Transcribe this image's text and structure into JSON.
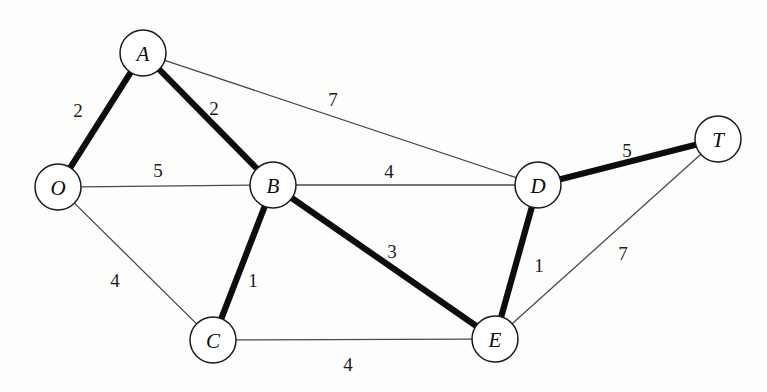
{
  "diagram": {
    "type": "weighted-undirected-graph",
    "title": "",
    "width": 767,
    "height": 392,
    "background_color": "#fdfdfc",
    "node_radius": 23,
    "node_fill": "#ffffff",
    "node_stroke": "#1a1a1a",
    "thin_edge_color": "#4a4a4a",
    "bold_edge_color": "#0d0d0d",
    "nodes": [
      {
        "id": "A",
        "label": "A",
        "x": 143,
        "y": 53
      },
      {
        "id": "O",
        "label": "O",
        "x": 58,
        "y": 187
      },
      {
        "id": "B",
        "label": "B",
        "x": 273,
        "y": 185
      },
      {
        "id": "D",
        "label": "D",
        "x": 538,
        "y": 185
      },
      {
        "id": "T",
        "label": "T",
        "x": 718,
        "y": 139
      },
      {
        "id": "C",
        "label": "C",
        "x": 213,
        "y": 340
      },
      {
        "id": "E",
        "label": "E",
        "x": 495,
        "y": 339
      }
    ],
    "edges": [
      {
        "id": "O-A",
        "from": "O",
        "to": "A",
        "weight": "2",
        "highlighted": true,
        "label_x": 78,
        "label_y": 110
      },
      {
        "id": "A-B",
        "from": "A",
        "to": "B",
        "weight": "2",
        "highlighted": true,
        "label_x": 214,
        "label_y": 108
      },
      {
        "id": "A-D",
        "from": "A",
        "to": "D",
        "weight": "7",
        "highlighted": false,
        "label_x": 333,
        "label_y": 99
      },
      {
        "id": "O-B",
        "from": "O",
        "to": "B",
        "weight": "5",
        "highlighted": false,
        "label_x": 158,
        "label_y": 170
      },
      {
        "id": "B-D",
        "from": "B",
        "to": "D",
        "weight": "4",
        "highlighted": false,
        "label_x": 389,
        "label_y": 171
      },
      {
        "id": "D-T",
        "from": "D",
        "to": "T",
        "weight": "5",
        "highlighted": true,
        "label_x": 627,
        "label_y": 150
      },
      {
        "id": "O-C",
        "from": "O",
        "to": "C",
        "weight": "4",
        "highlighted": false,
        "label_x": 115,
        "label_y": 280
      },
      {
        "id": "B-C",
        "from": "B",
        "to": "C",
        "weight": "1",
        "highlighted": true,
        "label_x": 253,
        "label_y": 280
      },
      {
        "id": "B-E",
        "from": "B",
        "to": "E",
        "weight": "3",
        "highlighted": true,
        "label_x": 392,
        "label_y": 251
      },
      {
        "id": "D-E",
        "from": "D",
        "to": "E",
        "weight": "1",
        "highlighted": true,
        "label_x": 539,
        "label_y": 265
      },
      {
        "id": "E-T",
        "from": "E",
        "to": "T",
        "weight": "7",
        "highlighted": false,
        "label_x": 623,
        "label_y": 253
      },
      {
        "id": "C-E",
        "from": "C",
        "to": "E",
        "weight": "4",
        "highlighted": false,
        "label_x": 348,
        "label_y": 364
      }
    ]
  }
}
